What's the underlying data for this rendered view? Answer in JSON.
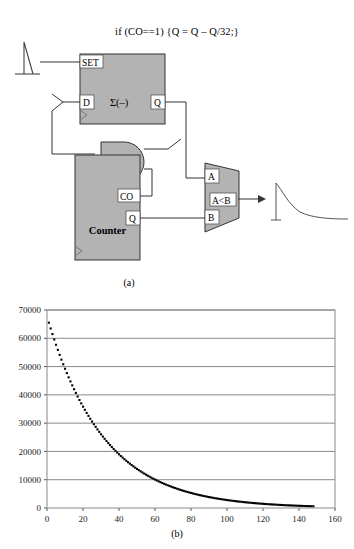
{
  "figure": {
    "code_comment": "if (CO==1) {Q = Q – Q/32;}",
    "panel_a_label": "(a)",
    "panel_b_label": "(b)"
  },
  "schematic": {
    "register": {
      "name": "accumulator-register",
      "body_label": "Σ(–)",
      "pins": {
        "set": "SET",
        "d": "D",
        "q": "Q"
      },
      "fill": "#b3b3b3",
      "stroke": "#333333"
    },
    "counter": {
      "name": "counter-block",
      "body_label": "Counter",
      "pins": {
        "co": "CO",
        "q": "Q"
      },
      "fill": "#b3b3b3",
      "stroke": "#333333"
    },
    "comparator": {
      "name": "comparator-block",
      "body_label": "A<B",
      "pins": {
        "a": "A",
        "b": "B"
      },
      "fill": "#b3b3b3",
      "stroke": "#333333"
    },
    "and_gate": {
      "name": "and-gate",
      "fill": "#b3b3b3",
      "stroke": "#333333"
    },
    "input_spike": {
      "name": "input-pulse-waveform"
    },
    "output_wave": {
      "name": "output-decay-waveform"
    },
    "divider_symbol": {
      "name": "shift-divide-wire-junction"
    }
  },
  "chart_data": {
    "type": "scatter",
    "title": "",
    "xlabel": "",
    "ylabel": "",
    "xlim": [
      0,
      160
    ],
    "ylim": [
      0,
      70000
    ],
    "xticks": [
      0,
      20,
      40,
      60,
      80,
      100,
      120,
      140,
      160
    ],
    "yticks": [
      0,
      10000,
      20000,
      30000,
      40000,
      50000,
      60000,
      70000
    ],
    "xtick_labels": [
      "0",
      "20",
      "40",
      "60",
      "80",
      "100",
      "120",
      "140",
      "160"
    ],
    "ytick_labels": [
      "0",
      "10000",
      "20000",
      "30000",
      "40000",
      "50000",
      "60000",
      "70000"
    ],
    "grid": {
      "horizontal": true,
      "vertical": false
    },
    "legend": null,
    "series": [
      {
        "name": "Q decay",
        "marker": "square",
        "color": "#000000",
        "formula": "Q(n) = 65536 * (31/32)^n",
        "x": [
          1,
          2,
          3,
          4,
          5,
          6,
          7,
          8,
          9,
          10,
          11,
          12,
          13,
          14,
          15,
          16,
          17,
          18,
          19,
          20,
          21,
          22,
          23,
          24,
          25,
          26,
          27,
          28,
          29,
          30,
          31,
          32,
          33,
          34,
          35,
          36,
          37,
          38,
          39,
          40,
          41,
          42,
          43,
          44,
          45,
          46,
          47,
          48,
          49,
          50,
          51,
          52,
          53,
          54,
          55,
          56,
          57,
          58,
          59,
          60,
          61,
          62,
          63,
          64,
          65,
          66,
          67,
          68,
          69,
          70,
          71,
          72,
          73,
          74,
          75,
          76,
          77,
          78,
          79,
          80,
          81,
          82,
          83,
          84,
          85,
          86,
          87,
          88,
          89,
          90,
          91,
          92,
          93,
          94,
          95,
          96,
          97,
          98,
          99,
          100,
          101,
          102,
          103,
          104,
          105,
          106,
          107,
          108,
          109,
          110,
          111,
          112,
          113,
          114,
          115,
          116,
          117,
          118,
          119,
          120,
          121,
          122,
          123,
          124,
          125,
          126,
          127,
          128,
          129,
          130,
          131,
          132,
          133,
          134,
          135,
          136,
          137,
          138,
          139,
          140,
          141,
          142,
          143,
          144,
          145,
          146,
          147,
          148
        ],
        "y": [
          65536,
          63488,
          61504,
          59581,
          57719,
          55915,
          54167,
          52474,
          50834,
          49245,
          47706,
          46215,
          44771,
          43371,
          42016,
          40703,
          39431,
          38198,
          37004,
          35848,
          34727,
          33641,
          32589,
          31570,
          30583,
          29627,
          28701,
          27804,
          26935,
          26093,
          25278,
          24488,
          23723,
          22982,
          22264,
          21568,
          20894,
          20241,
          19608,
          18995,
          18402,
          17827,
          17270,
          16730,
          16207,
          15701,
          15210,
          14735,
          14274,
          13828,
          13396,
          12977,
          12572,
          12179,
          11798,
          11430,
          11073,
          10727,
          10391,
          10067,
          9752,
          9447,
          9152,
          8866,
          8589,
          8320,
          8060,
          7808,
          7564,
          7328,
          7099,
          6877,
          6662,
          6454,
          6252,
          6057,
          5868,
          5684,
          5506,
          5334,
          5167,
          5006,
          4849,
          4698,
          4551,
          4409,
          4271,
          4138,
          4009,
          3884,
          3762,
          3645,
          3531,
          3421,
          3314,
          3210,
          3110,
          3013,
          2919,
          2827,
          2739,
          2654,
          2571,
          2490,
          2412,
          2337,
          2264,
          2193,
          2124,
          2058,
          1993,
          1931,
          1871,
          1812,
          1755,
          1700,
          1647,
          1596,
          1546,
          1498,
          1451,
          1406,
          1362,
          1319,
          1278,
          1238,
          1199,
          1162,
          1125,
          1090,
          1056,
          1023,
          991,
          960,
          930,
          901,
          873,
          846,
          819,
          794,
          769,
          745,
          722,
          699,
          677,
          656,
          636,
          616
        ]
      }
    ]
  }
}
